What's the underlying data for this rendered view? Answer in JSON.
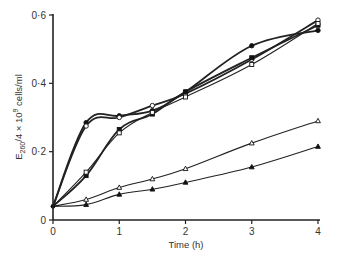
{
  "chart_data": {
    "type": "line",
    "title": "",
    "xlabel": "Time (h)",
    "ylabel": "E260/4 × 10^9 cells/ml",
    "ylabel_parts": {
      "main": "E",
      "sub": "260",
      "rest": "/4 × 10",
      "sup": "9",
      "tail": " cells/ml"
    },
    "xlim": [
      0,
      4
    ],
    "ylim": [
      0,
      0.6
    ],
    "x_ticks": [
      0,
      1,
      2,
      3,
      4
    ],
    "x_tick_labels": [
      "0",
      "1",
      "2",
      "3",
      "4"
    ],
    "y_ticks": [
      0,
      0.2,
      0.4,
      0.6
    ],
    "y_tick_labels": [
      "0",
      "0·2",
      "0·4",
      "0·6"
    ],
    "grid": false,
    "legend": "none",
    "series": [
      {
        "name": "filled circles",
        "marker": "circle-filled",
        "heavy": true,
        "x": [
          0,
          0.5,
          1,
          1.5,
          2,
          3,
          4
        ],
        "values": [
          0.04,
          0.285,
          0.305,
          0.32,
          0.375,
          0.51,
          0.555
        ]
      },
      {
        "name": "open circles",
        "marker": "circle-open",
        "heavy": true,
        "x": [
          0,
          0.5,
          1,
          1.5,
          2,
          3,
          4
        ],
        "values": [
          0.04,
          0.275,
          0.3,
          0.335,
          0.37,
          0.47,
          0.585
        ]
      },
      {
        "name": "filled squares",
        "marker": "square-filled",
        "heavy": true,
        "x": [
          0,
          0.5,
          1,
          1.5,
          2,
          3,
          4
        ],
        "values": [
          0.04,
          0.13,
          0.265,
          0.31,
          0.375,
          0.475,
          0.57
        ]
      },
      {
        "name": "open squares",
        "marker": "square-open",
        "heavy": false,
        "x": [
          0,
          0.5,
          1,
          1.5,
          2,
          3,
          4
        ],
        "values": [
          0.04,
          0.14,
          0.255,
          0.315,
          0.36,
          0.455,
          0.575
        ]
      },
      {
        "name": "open triangles",
        "marker": "triangle-open",
        "heavy": false,
        "x": [
          0,
          0.5,
          1,
          1.5,
          2,
          3,
          4
        ],
        "values": [
          0.04,
          0.06,
          0.095,
          0.12,
          0.15,
          0.225,
          0.29
        ]
      },
      {
        "name": "filled triangles",
        "marker": "triangle-filled",
        "heavy": false,
        "x": [
          0,
          0.5,
          1,
          1.5,
          2,
          3,
          4
        ],
        "values": [
          0.04,
          0.045,
          0.075,
          0.09,
          0.11,
          0.155,
          0.215
        ]
      }
    ]
  }
}
